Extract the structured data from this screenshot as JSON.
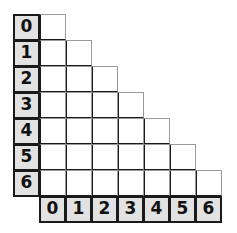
{
  "figure": {
    "type": "triangular-grid-table",
    "row_headers": [
      "0",
      "1",
      "2",
      "3",
      "4",
      "5",
      "6"
    ],
    "column_headers": [
      "0",
      "1",
      "2",
      "3",
      "4",
      "5",
      "6"
    ],
    "row_cell_counts": [
      1,
      2,
      3,
      4,
      5,
      6,
      7
    ],
    "colors": {
      "header_fill": "#e2e2e2",
      "cell_fill": "#ffffff",
      "heavy_border": "#1a1a1a",
      "light_border": "#9a9a9a",
      "background": "#ffffff"
    },
    "geometry": {
      "origin_x": 13,
      "origin_y": 14,
      "cell_pitch": 26,
      "rows": 7,
      "columns": 7
    }
  }
}
